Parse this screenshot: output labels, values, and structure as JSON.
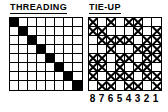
{
  "sections": {
    "threading": {
      "heading": "THREADING",
      "rows": 8,
      "cols": 8,
      "cell_symbol": "filled-square",
      "pattern": [
        [
          1,
          0,
          0,
          0,
          0,
          0,
          0,
          0
        ],
        [
          0,
          1,
          0,
          0,
          0,
          0,
          0,
          0
        ],
        [
          0,
          0,
          1,
          0,
          0,
          0,
          0,
          0
        ],
        [
          0,
          0,
          0,
          1,
          0,
          0,
          0,
          0
        ],
        [
          0,
          0,
          0,
          0,
          1,
          0,
          0,
          0
        ],
        [
          0,
          0,
          0,
          0,
          0,
          1,
          0,
          0
        ],
        [
          0,
          0,
          0,
          0,
          0,
          0,
          1,
          0
        ],
        [
          0,
          0,
          0,
          0,
          0,
          0,
          0,
          1
        ]
      ]
    },
    "tieup": {
      "heading": "TIE-UP",
      "rows": 8,
      "cols": 8,
      "cell_symbol": "x-mark",
      "pattern": [
        [
          1,
          0,
          1,
          0,
          1,
          1,
          0,
          0
        ],
        [
          1,
          1,
          0,
          0,
          0,
          1,
          0,
          1
        ],
        [
          0,
          1,
          1,
          1,
          1,
          0,
          1,
          1
        ],
        [
          0,
          0,
          1,
          0,
          0,
          1,
          1,
          1
        ],
        [
          1,
          1,
          0,
          1,
          1,
          0,
          1,
          1
        ],
        [
          1,
          1,
          0,
          1,
          0,
          1,
          1,
          0
        ],
        [
          1,
          0,
          1,
          1,
          1,
          0,
          1,
          1
        ],
        [
          0,
          1,
          1,
          0,
          1,
          1,
          0,
          1
        ]
      ]
    }
  },
  "shaft_numbers": [
    "8",
    "7",
    "6",
    "5",
    "4",
    "3",
    "2",
    "1"
  ],
  "colors": {
    "ink": "#000000",
    "paper": "#ffffff"
  }
}
